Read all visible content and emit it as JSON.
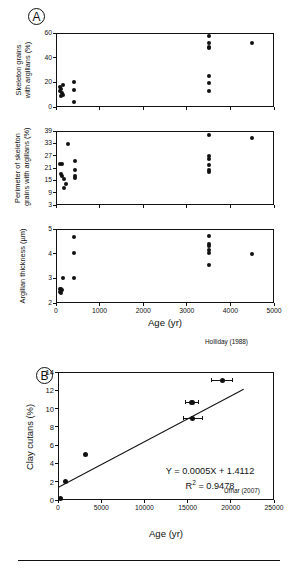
{
  "figure": {
    "panels": [
      {
        "tag": "A",
        "source_attribution": "Holliday (1988)",
        "x_axis_label": "Age (yr)",
        "subplots": [
          {
            "y_axis_label_line1": "Skeleton grains",
            "y_axis_label_line2": "with argillans (%)",
            "y_ticks": [
              "0",
              "20",
              "40",
              "60"
            ],
            "x_ticks": [
              "0",
              "1000",
              "2000",
              "3000",
              "4000",
              "5000"
            ]
          },
          {
            "y_axis_label_line1": "Perimeter of skeleton",
            "y_axis_label_line2": "grains with argillans (%)",
            "y_ticks": [
              "3",
              "9",
              "15",
              "21",
              "27",
              "33",
              "39"
            ],
            "x_ticks": [
              "0",
              "1000",
              "2000",
              "3000",
              "4000",
              "5000"
            ]
          },
          {
            "y_axis_label_line1": "Argillan thickness (µm)",
            "y_axis_label_line2": "",
            "y_ticks": [
              "2",
              "3",
              "4",
              "5"
            ],
            "x_ticks": [
              "0",
              "1000",
              "2000",
              "3000",
              "4000",
              "5000"
            ]
          }
        ]
      },
      {
        "tag": "B",
        "source_attribution": "Ufnar (2007)",
        "x_axis_label": "Age (yr)",
        "y_axis_label": "Clay cutans (%)",
        "equation": "Y = 0.0005X + 1.4112",
        "r_squared_label": "R",
        "r_squared_sup": "2",
        "r_squared_value": " = 0.9478",
        "y_ticks": [
          "0",
          "2",
          "4",
          "6",
          "8",
          "10",
          "12",
          "14"
        ],
        "x_ticks": [
          "0",
          "5000",
          "10000",
          "15000",
          "20000",
          "25000"
        ]
      }
    ]
  },
  "chart_data": [
    {
      "type": "scatter",
      "panel": "A1",
      "title": "Skeleton grains with argillans (%) vs Age",
      "xlabel": "Age (yr)",
      "ylabel": "Skeleton grains with argillans (%)",
      "xlim": [
        0,
        5000
      ],
      "ylim": [
        0,
        60
      ],
      "xticks": [
        0,
        1000,
        2000,
        3000,
        4000,
        5000
      ],
      "yticks": [
        0,
        20,
        40,
        60
      ],
      "grid": false,
      "legend": "none",
      "annotation": "Holliday (1988)",
      "points": [
        {
          "x": 100,
          "y": 16.5
        },
        {
          "x": 120,
          "y": 15.0
        },
        {
          "x": 100,
          "y": 13.0
        },
        {
          "x": 150,
          "y": 17.5
        },
        {
          "x": 130,
          "y": 11.0
        },
        {
          "x": 110,
          "y": 9.0
        },
        {
          "x": 160,
          "y": 9.5
        },
        {
          "x": 420,
          "y": 20.0
        },
        {
          "x": 420,
          "y": 13.5
        },
        {
          "x": 420,
          "y": 4.0
        },
        {
          "x": 3500,
          "y": 57.5
        },
        {
          "x": 3500,
          "y": 51.5
        },
        {
          "x": 3500,
          "y": 49.0
        },
        {
          "x": 3500,
          "y": 47.5
        },
        {
          "x": 3500,
          "y": 25.5
        },
        {
          "x": 3500,
          "y": 19.5
        },
        {
          "x": 3500,
          "y": 13.0
        },
        {
          "x": 4500,
          "y": 51.5
        }
      ]
    },
    {
      "type": "scatter",
      "panel": "A2",
      "title": "Perimeter of skeleton grains with argillans (%) vs Age",
      "xlabel": "Age (yr)",
      "ylabel": "Perimeter of skeleton grains with argillans (%)",
      "xlim": [
        0,
        5000
      ],
      "ylim": [
        3,
        39
      ],
      "xticks": [
        0,
        1000,
        2000,
        3000,
        4000,
        5000
      ],
      "yticks": [
        3,
        9,
        15,
        21,
        27,
        33,
        39
      ],
      "grid": false,
      "legend": "none",
      "annotation": "Holliday (1988)",
      "points": [
        {
          "x": 280,
          "y": 32.6
        },
        {
          "x": 100,
          "y": 23.0
        },
        {
          "x": 130,
          "y": 22.8
        },
        {
          "x": 110,
          "y": 18.0
        },
        {
          "x": 130,
          "y": 17.3
        },
        {
          "x": 190,
          "y": 15.8
        },
        {
          "x": 230,
          "y": 13.2
        },
        {
          "x": 180,
          "y": 11.3
        },
        {
          "x": 430,
          "y": 24.2
        },
        {
          "x": 430,
          "y": 20.2
        },
        {
          "x": 430,
          "y": 17.3
        },
        {
          "x": 430,
          "y": 16.0
        },
        {
          "x": 3500,
          "y": 37.2
        },
        {
          "x": 3500,
          "y": 26.6
        },
        {
          "x": 3500,
          "y": 25.6
        },
        {
          "x": 3500,
          "y": 22.6
        },
        {
          "x": 3500,
          "y": 19.8
        },
        {
          "x": 3500,
          "y": 19.0
        },
        {
          "x": 4500,
          "y": 35.5
        }
      ]
    },
    {
      "type": "scatter",
      "panel": "A3",
      "title": "Argillan thickness (µm) vs Age",
      "xlabel": "Age (yr)",
      "ylabel": "Argillan thickness (µm)",
      "xlim": [
        0,
        5000
      ],
      "ylim": [
        2,
        5
      ],
      "xticks": [
        0,
        1000,
        2000,
        3000,
        4000,
        5000
      ],
      "yticks": [
        2,
        3,
        4,
        5
      ],
      "grid": false,
      "legend": "none",
      "annotation": "Holliday (1988)",
      "points": [
        {
          "x": 420,
          "y": 4.66
        },
        {
          "x": 420,
          "y": 4.02
        },
        {
          "x": 170,
          "y": 3.0
        },
        {
          "x": 420,
          "y": 3.0
        },
        {
          "x": 90,
          "y": 2.58
        },
        {
          "x": 110,
          "y": 2.55
        },
        {
          "x": 130,
          "y": 2.52
        },
        {
          "x": 100,
          "y": 2.45
        },
        {
          "x": 120,
          "y": 2.4
        },
        {
          "x": 3500,
          "y": 4.72
        },
        {
          "x": 3500,
          "y": 4.38
        },
        {
          "x": 3500,
          "y": 4.32
        },
        {
          "x": 3500,
          "y": 4.16
        },
        {
          "x": 3500,
          "y": 4.02
        },
        {
          "x": 3500,
          "y": 3.56
        },
        {
          "x": 4500,
          "y": 4.0
        }
      ]
    },
    {
      "type": "scatter",
      "panel": "B",
      "title": "Clay cutans (%) vs Age",
      "xlabel": "Age (yr)",
      "ylabel": "Clay cutans (%)",
      "xlim": [
        0,
        25000
      ],
      "ylim": [
        0,
        14
      ],
      "xticks": [
        0,
        5000,
        10000,
        15000,
        20000,
        25000
      ],
      "yticks": [
        0,
        2,
        4,
        6,
        8,
        10,
        12,
        14
      ],
      "grid": false,
      "legend": "none",
      "annotation": "Ufnar (2007)",
      "fit_equation": "Y = 0.0005X + 1.4112",
      "r_squared": 0.9478,
      "fit_line": {
        "x0": 0,
        "y0": 1.4112,
        "x1": 21500,
        "y1": 12.16
      },
      "points": [
        {
          "x": 300,
          "y": 0.2,
          "xerr": 0
        },
        {
          "x": 900,
          "y": 2.0,
          "xerr": 0
        },
        {
          "x": 3200,
          "y": 4.95,
          "xerr": 0
        },
        {
          "x": 15600,
          "y": 8.95,
          "xerr": 1100
        },
        {
          "x": 15500,
          "y": 10.7,
          "xerr": 800
        },
        {
          "x": 19000,
          "y": 13.1,
          "xerr": 1200
        }
      ]
    }
  ]
}
